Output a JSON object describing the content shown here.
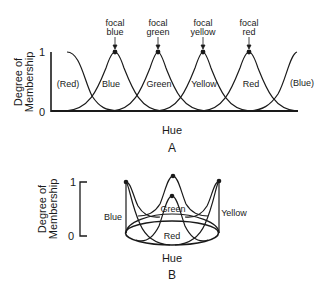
{
  "panel_a": {
    "y_axis_label_line1": "Degree of",
    "y_axis_label_line2": "Membership",
    "y_tick_top": "1",
    "y_tick_bottom": "0",
    "x_axis_label": "Hue",
    "panel_letter": "A",
    "curve_labels": [
      "(Red)",
      "Blue",
      "Green",
      "Yellow",
      "Red",
      "(Blue)"
    ],
    "focal_labels": [
      {
        "line1": "focal",
        "line2": "blue"
      },
      {
        "line1": "focal",
        "line2": "green"
      },
      {
        "line1": "focal",
        "line2": "yellow"
      },
      {
        "line1": "focal",
        "line2": "red"
      }
    ]
  },
  "panel_b": {
    "y_axis_label_line1": "Degree of",
    "y_axis_label_line2": "Membership",
    "y_tick_top": "1",
    "y_tick_bottom": "0",
    "x_axis_label": "Hue",
    "panel_letter": "B",
    "curve_labels": {
      "left": "Blue",
      "back": "Green",
      "right": "Yellow",
      "front": "Red"
    }
  },
  "colors": {
    "ink": "#1a1a1a",
    "background": "#ffffff"
  }
}
